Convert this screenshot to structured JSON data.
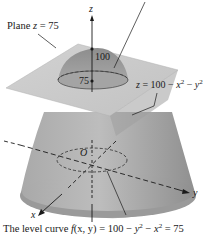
{
  "figure": {
    "type": "3d-surface-diagram",
    "labels": {
      "plane": "Plane z = 75",
      "plane_prefix": "Plane ",
      "plane_var": "z",
      "plane_eq": " = 75",
      "surface_var": "z",
      "surface_eq_a": " = 100 − ",
      "surface_x": "x",
      "surface_mid": " − ",
      "surface_y": "y",
      "exp": "2",
      "z_axis": "z",
      "x_axis": "x",
      "y_axis": "y",
      "origin": "O",
      "tick_100": "100",
      "tick_75": "75",
      "caption_prefix": "The level curve ",
      "caption_f": "f",
      "caption_args": "(x, y)",
      "caption_eq": " = 100 − ",
      "caption_y": "y",
      "caption_mid": " − ",
      "caption_x": "x",
      "caption_end": " = 75"
    },
    "colors": {
      "plane": "#c9c9c9",
      "plane_edge": "#b5b5b5",
      "surface_light": "#b8b8b8",
      "surface_dark": "#8e8e8e",
      "cap": "#9c9c9c",
      "lines": "#1a1a1a"
    }
  }
}
